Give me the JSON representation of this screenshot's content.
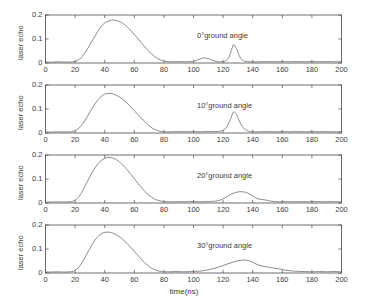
{
  "chart_data": [
    {
      "type": "line",
      "title": "",
      "subtitle": "",
      "annotation": "0°ground angle",
      "xlabel": "",
      "ylabel": "laser echo",
      "xlim": [
        0,
        200
      ],
      "ylim": [
        0,
        0.2
      ],
      "xticks": [
        0,
        20,
        40,
        60,
        80,
        100,
        120,
        140,
        160,
        180,
        200
      ],
      "yticks": [
        0,
        0.1,
        0.2
      ],
      "ytick_labels": [
        "0",
        "0.1",
        "0.2"
      ],
      "grid": false,
      "legend": "none",
      "series": [
        {
          "name": "laser echo 0 deg",
          "x": [
            0,
            4,
            8,
            12,
            16,
            20,
            22,
            25,
            28,
            31,
            34,
            37,
            40,
            43,
            46,
            49,
            52,
            55,
            58,
            61,
            64,
            67,
            70,
            73,
            76,
            79,
            82,
            86,
            90,
            94,
            98,
            101,
            104,
            107,
            110,
            113,
            116,
            119,
            122,
            124,
            126,
            127,
            129,
            131,
            133,
            136,
            140,
            145,
            150,
            155,
            160,
            165,
            170,
            175,
            180,
            185,
            190,
            195,
            200
          ],
          "values": [
            0.004,
            0.003,
            0.005,
            0.004,
            0.004,
            0.006,
            0.012,
            0.028,
            0.055,
            0.087,
            0.118,
            0.147,
            0.167,
            0.176,
            0.179,
            0.175,
            0.166,
            0.152,
            0.133,
            0.112,
            0.09,
            0.068,
            0.048,
            0.031,
            0.018,
            0.01,
            0.006,
            0.005,
            0.006,
            0.005,
            0.006,
            0.009,
            0.016,
            0.021,
            0.018,
            0.011,
            0.006,
            0.005,
            0.009,
            0.025,
            0.06,
            0.076,
            0.06,
            0.03,
            0.012,
            0.006,
            0.005,
            0.005,
            0.006,
            0.005,
            0.006,
            0.005,
            0.006,
            0.005,
            0.006,
            0.005,
            0.006,
            0.005,
            0.006
          ]
        }
      ]
    },
    {
      "type": "line",
      "title": "",
      "subtitle": "",
      "annotation": "10°ground angle",
      "xlabel": "",
      "ylabel": "laser echo",
      "xlim": [
        0,
        200
      ],
      "ylim": [
        0,
        0.2
      ],
      "xticks": [
        0,
        20,
        40,
        60,
        80,
        100,
        120,
        140,
        160,
        180,
        200
      ],
      "yticks": [
        0,
        0.1,
        0.2
      ],
      "ytick_labels": [
        "0",
        "0.1",
        "0.2"
      ],
      "grid": false,
      "legend": "none",
      "series": [
        {
          "name": "laser echo 10 deg",
          "x": [
            0,
            4,
            8,
            12,
            16,
            19,
            22,
            25,
            28,
            31,
            34,
            37,
            40,
            43,
            45,
            48,
            51,
            54,
            57,
            60,
            63,
            66,
            69,
            72,
            75,
            78,
            81,
            85,
            90,
            95,
            100,
            105,
            110,
            115,
            119,
            122,
            125,
            127,
            129,
            131,
            133,
            136,
            140,
            145,
            150,
            155,
            160,
            165,
            170,
            175,
            180,
            185,
            190,
            195,
            200
          ],
          "values": [
            0.004,
            0.004,
            0.005,
            0.004,
            0.005,
            0.007,
            0.017,
            0.037,
            0.066,
            0.098,
            0.127,
            0.149,
            0.162,
            0.165,
            0.164,
            0.157,
            0.146,
            0.131,
            0.113,
            0.093,
            0.073,
            0.054,
            0.036,
            0.021,
            0.012,
            0.007,
            0.005,
            0.005,
            0.006,
            0.005,
            0.006,
            0.005,
            0.006,
            0.006,
            0.009,
            0.022,
            0.057,
            0.087,
            0.078,
            0.05,
            0.026,
            0.01,
            0.005,
            0.005,
            0.006,
            0.005,
            0.006,
            0.005,
            0.006,
            0.005,
            0.006,
            0.005,
            0.006,
            0.005,
            0.006
          ]
        }
      ]
    },
    {
      "type": "line",
      "title": "",
      "subtitle": "",
      "annotation": "20°ground angle",
      "xlabel": "",
      "ylabel": "laser echo",
      "xlim": [
        0,
        200
      ],
      "ylim": [
        0,
        0.2
      ],
      "xticks": [
        0,
        20,
        40,
        60,
        80,
        100,
        120,
        140,
        160,
        180,
        200
      ],
      "yticks": [
        0,
        0.1,
        0.2
      ],
      "ytick_labels": [
        "0",
        "0.1",
        "0.2"
      ],
      "grid": false,
      "legend": "none",
      "series": [
        {
          "name": "laser echo 20 deg",
          "x": [
            0,
            4,
            8,
            12,
            16,
            19,
            22,
            25,
            28,
            31,
            34,
            37,
            40,
            43,
            46,
            49,
            52,
            55,
            58,
            61,
            64,
            67,
            70,
            73,
            76,
            79,
            82,
            86,
            90,
            95,
            100,
            105,
            110,
            115,
            118,
            121,
            124,
            127,
            130,
            133,
            136,
            139,
            141,
            143,
            146,
            149,
            153,
            158,
            163,
            168,
            173,
            178,
            183,
            188,
            193,
            200
          ],
          "values": [
            0.004,
            0.004,
            0.005,
            0.004,
            0.005,
            0.008,
            0.022,
            0.05,
            0.086,
            0.122,
            0.152,
            0.174,
            0.186,
            0.19,
            0.186,
            0.176,
            0.16,
            0.14,
            0.117,
            0.093,
            0.07,
            0.049,
            0.032,
            0.019,
            0.011,
            0.007,
            0.005,
            0.005,
            0.006,
            0.005,
            0.006,
            0.005,
            0.006,
            0.008,
            0.012,
            0.021,
            0.032,
            0.041,
            0.046,
            0.047,
            0.043,
            0.033,
            0.026,
            0.018,
            0.015,
            0.012,
            0.007,
            0.005,
            0.006,
            0.005,
            0.006,
            0.005,
            0.006,
            0.005,
            0.006,
            0.005
          ]
        }
      ]
    },
    {
      "type": "line",
      "title": "",
      "subtitle": "",
      "annotation": "30°ground angle",
      "xlabel": "time(ns)",
      "ylabel": "laser echo",
      "xlim": [
        0,
        200
      ],
      "ylim": [
        0,
        0.2
      ],
      "xticks": [
        0,
        20,
        40,
        60,
        80,
        100,
        120,
        140,
        160,
        180,
        200
      ],
      "yticks": [
        0,
        0.1,
        0.2
      ],
      "ytick_labels": [
        "0",
        "0.1",
        "0.2"
      ],
      "grid": false,
      "legend": "none",
      "series": [
        {
          "name": "laser echo 30 deg",
          "x": [
            0,
            4,
            8,
            12,
            16,
            19,
            22,
            25,
            28,
            31,
            34,
            37,
            40,
            43,
            46,
            49,
            52,
            55,
            58,
            61,
            64,
            67,
            70,
            73,
            76,
            79,
            83,
            88,
            93,
            98,
            103,
            108,
            112,
            116,
            120,
            124,
            128,
            132,
            135,
            138,
            141,
            144,
            147,
            150,
            154,
            158,
            162,
            166,
            170,
            175,
            180,
            185,
            190,
            195,
            200
          ],
          "values": [
            0.004,
            0.004,
            0.005,
            0.004,
            0.005,
            0.008,
            0.021,
            0.046,
            0.08,
            0.113,
            0.142,
            0.161,
            0.169,
            0.17,
            0.165,
            0.155,
            0.141,
            0.124,
            0.104,
            0.083,
            0.062,
            0.043,
            0.027,
            0.016,
            0.009,
            0.006,
            0.005,
            0.006,
            0.005,
            0.006,
            0.007,
            0.011,
            0.016,
            0.023,
            0.031,
            0.04,
            0.048,
            0.053,
            0.054,
            0.05,
            0.041,
            0.033,
            0.028,
            0.025,
            0.021,
            0.017,
            0.012,
            0.009,
            0.007,
            0.006,
            0.005,
            0.006,
            0.005,
            0.006,
            0.005
          ]
        }
      ]
    }
  ],
  "axis": {
    "xlabel": "time(ns)",
    "ylabel": "laser echo",
    "xtick_labels": [
      "0",
      "20",
      "40",
      "60",
      "80",
      "100",
      "120",
      "140",
      "160",
      "180",
      "200"
    ],
    "ytick_labels": [
      "0",
      "0.1",
      "0.2"
    ]
  },
  "panels": [
    {
      "annotation": "0°ground angle"
    },
    {
      "annotation": "10°ground angle"
    },
    {
      "annotation": "20°ground angle"
    },
    {
      "annotation": "30°ground angle"
    }
  ],
  "colors": {
    "background": "#ffffff",
    "axis": "#4a4a4a",
    "curve": "#6e6e6e",
    "text": "#3a3a3a"
  }
}
